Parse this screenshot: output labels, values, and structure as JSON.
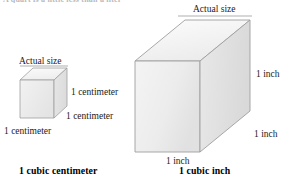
{
  "page": {
    "top_cut_text": "A quart is a little less than a liter",
    "background_color": "#ffffff"
  },
  "colors": {
    "face_top": "#f4f4f4",
    "face_front": "#ededed",
    "face_side": "#e3e3e3",
    "edge_stroke": "#9a9a9a",
    "text": "#1a1a1a"
  },
  "figures": [
    {
      "id": "cubic-centimeter",
      "actual_size_label": "Actual size",
      "caption": "1 cubic centimeter",
      "edge_labels": {
        "depth": "1 centimeter",
        "height": "1 centimeter",
        "width": "1 centimeter"
      }
    },
    {
      "id": "cubic-inch",
      "actual_size_label": "Actual size",
      "caption": "1 cubic inch",
      "edge_labels": {
        "depth": "1 inch",
        "height": "1 inch",
        "width": "1 inch"
      }
    }
  ]
}
